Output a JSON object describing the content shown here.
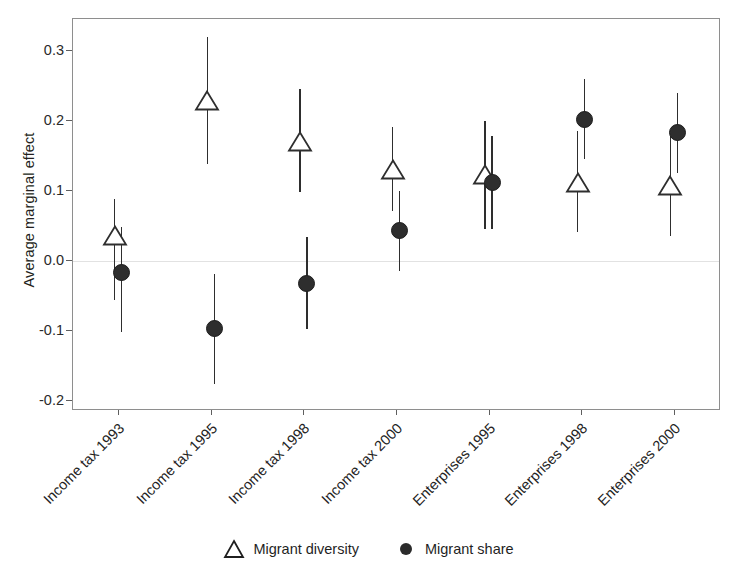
{
  "chart_data": {
    "type": "scatter",
    "title": "",
    "xlabel": "",
    "ylabel": "Average marginal effect",
    "ylim": [
      -0.215,
      0.345
    ],
    "yticks": [
      0.3,
      0.2,
      0.1,
      0.0,
      -0.1,
      -0.2
    ],
    "ytick_labels": [
      "0.3",
      "0.2",
      "0.1",
      "0.0",
      "-0.1",
      "-0.2"
    ],
    "grid": false,
    "zero_reference_line": 0.0,
    "legend_position": "bottom",
    "categories": [
      "Income tax 1993",
      "Income tax 1995",
      "Income tax 1998",
      "Income tax 2000",
      "Enterprises 1995",
      "Enterprises 1998",
      "Enterprises 2000"
    ],
    "series": [
      {
        "name": "Migrant diversity",
        "marker": "open-triangle",
        "color": "#2e2e2e",
        "values": [
          0.035,
          0.228,
          0.17,
          0.13,
          0.122,
          0.111,
          0.106
        ],
        "ci_low": [
          -0.058,
          0.137,
          0.097,
          0.07,
          0.043,
          0.039,
          0.034
        ],
        "ci_high": [
          0.087,
          0.318,
          0.243,
          0.19,
          0.198,
          0.183,
          0.177
        ]
      },
      {
        "name": "Migrant share",
        "marker": "filled-circle",
        "color": "#2e2e2e",
        "values": [
          -0.019,
          -0.099,
          -0.034,
          0.042,
          0.11,
          0.2,
          0.181
        ],
        "ci_low": [
          -0.104,
          -0.178,
          -0.1,
          -0.016,
          0.044,
          0.143,
          0.124
        ],
        "ci_high": [
          0.046,
          -0.02,
          0.032,
          0.098,
          0.176,
          0.258,
          0.238
        ]
      }
    ]
  },
  "legend": {
    "entries": [
      {
        "label": "Migrant diversity",
        "icon": "open-triangle-icon"
      },
      {
        "label": "Migrant share",
        "icon": "filled-circle-icon"
      }
    ]
  }
}
